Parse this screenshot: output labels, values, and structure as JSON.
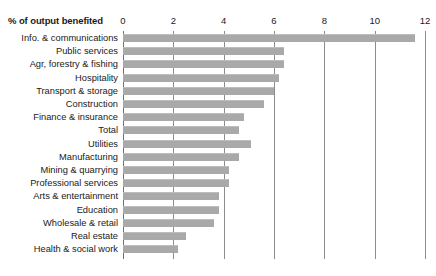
{
  "chart_data": {
    "type": "bar",
    "orientation": "horizontal",
    "title": "",
    "xlabel": "% of output benefited",
    "ylabel": "",
    "xlim": [
      0,
      12
    ],
    "xticks": [
      0,
      2,
      4,
      6,
      8,
      10,
      12
    ],
    "xtick_labels": [
      "0",
      "2",
      "4",
      "6",
      "8",
      "10",
      "12"
    ],
    "grid": true,
    "grid_axis": "x",
    "legend": false,
    "bar_color": "#a9a9a9",
    "categories": [
      "Info. & communications",
      "Public services",
      "Agr, forestry & fishing",
      "Hospitality",
      "Transport & storage",
      "Construction",
      "Finance & insurance",
      "Total",
      "Utilities",
      "Manufacturing",
      "Mining & quarrying",
      "Professional services",
      "Arts & entertainment",
      "Education",
      "Wholesale & retail",
      "Real estate",
      "Health & social work"
    ],
    "values": [
      11.6,
      6.4,
      6.4,
      6.2,
      6.0,
      5.6,
      4.8,
      4.6,
      5.1,
      4.6,
      4.2,
      4.2,
      3.8,
      3.8,
      3.6,
      2.5,
      2.2
    ]
  }
}
